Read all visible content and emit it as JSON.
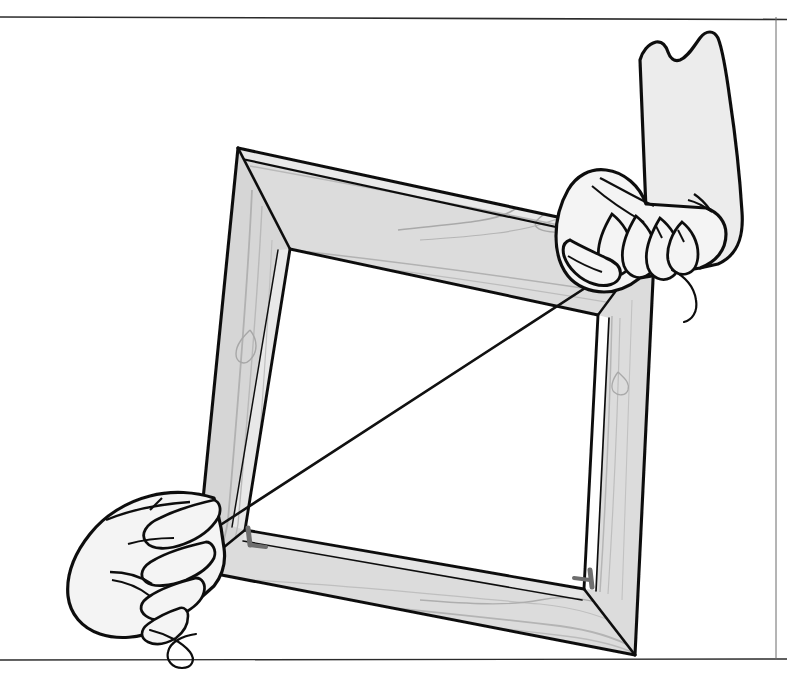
{
  "page": {
    "width": 787,
    "height": 693,
    "background_color": "#ffffff",
    "style": "black-and-white pen-and-ink line drawing with flat gray fills"
  },
  "rules": {
    "top_rule": {
      "name": "top-horizontal-rule",
      "y": 17,
      "x1": 0,
      "x2": 787,
      "color": "#2b2b2b",
      "thickness": 1.6
    },
    "bottom_rule": {
      "name": "bottom-horizontal-rule",
      "y": 660,
      "x1": 0,
      "x2": 787,
      "color": "#2b2b2b",
      "thickness": 1.4
    },
    "right_rule": {
      "name": "right-vertical-rule",
      "x": 776,
      "y1": 17,
      "y2": 660,
      "color": "#6b6b6b",
      "thickness": 1.0
    }
  },
  "colors": {
    "ink": "#111111",
    "wood_face_light": "#dcdcdc",
    "wood_face_mid": "#cfcfcf",
    "wood_edge_dark": "#b4b4b4",
    "wood_grain": "#a9a9a9",
    "skin_fill": "#f2f2f2",
    "sleeve_fill": "#e8e8e8",
    "staple_gray": "#6e6e6e",
    "paper": "#ffffff"
  },
  "scene": {
    "objects": [
      {
        "name": "wooden-picture-frame",
        "label": "Wooden picture frame",
        "description": "Rectangular mitered wood frame tilted clockwise, shown in perspective with visible inner bevel and wood grain",
        "outer_corners": {
          "top_left": [
            238,
            148
          ],
          "top_right": [
            655,
            238
          ],
          "bottom_right": [
            635,
            655
          ],
          "bottom_left": [
            196,
            570
          ]
        },
        "inner_corners": {
          "top_left": [
            290,
            249
          ],
          "top_right": [
            598,
            315
          ],
          "bottom_right": [
            584,
            589
          ],
          "bottom_left": [
            245,
            530
          ]
        },
        "members": [
          "top-rail",
          "right-stile",
          "bottom-rail",
          "left-stile"
        ],
        "joint_type": "mitered",
        "fasteners": [
          {
            "name": "corner-staple-bottom-left",
            "x": 246,
            "y": 536
          },
          {
            "name": "corner-staple-bottom-right",
            "x": 588,
            "y": 580
          }
        ]
      },
      {
        "name": "right-hand",
        "label": "Right hand gripping the upper-right frame corner",
        "grip_point": [
          620,
          262
        ],
        "cuff_top": [
          690,
          42
        ],
        "description": "Hand with shirt cuff, fingers curled over the top-right corner, pinching the string end"
      },
      {
        "name": "left-hand",
        "label": "Left hand gripping the lower-left frame corner",
        "grip_point": [
          205,
          535
        ],
        "description": "Hand with fingers curled around the lower-left corner, pinching the other string end"
      },
      {
        "name": "diagonal-string",
        "label": "Measuring string stretched across the diagonal",
        "from": [
          205,
          535
        ],
        "to": [
          602,
          277
        ],
        "purpose": "Compare diagonal lengths to verify the frame is square"
      },
      {
        "name": "string-tail-right",
        "label": "Loose string tail hanging from the right hand",
        "anchor": [
          668,
          278
        ]
      },
      {
        "name": "string-tail-left",
        "label": "Loose string tail curling below the left hand",
        "anchor": [
          130,
          620
        ]
      }
    ]
  },
  "annotations": {
    "visible_text": [],
    "note": "The illustration contains no printed labels, captions, numbers or legends."
  }
}
